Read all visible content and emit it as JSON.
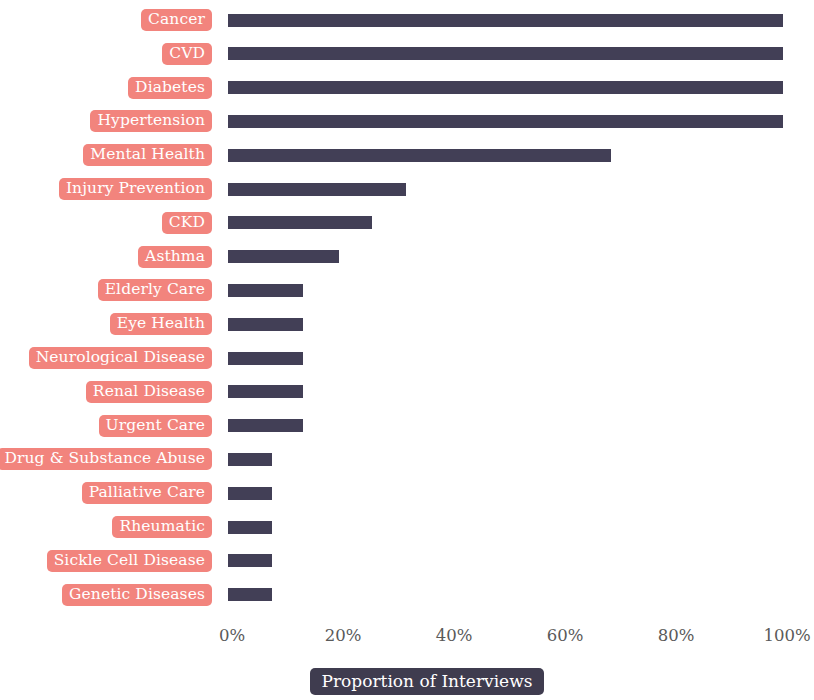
{
  "chart_data": {
    "type": "bar",
    "orientation": "horizontal",
    "title": "",
    "subtitle": "",
    "xlabel": "Proportion of Interviews",
    "ylabel": "",
    "xlim": [
      0,
      100
    ],
    "ylim": null,
    "grid": false,
    "legend": null,
    "legend_position": "none",
    "xtick_labels": [
      "0%",
      "20%",
      "40%",
      "60%",
      "80%",
      "100%"
    ],
    "xtick_values": [
      0,
      20,
      40,
      60,
      80,
      100
    ],
    "categories": [
      "Cancer",
      "CVD",
      "Diabetes",
      "Hypertension",
      "Mental Health",
      "Injury Prevention",
      "CKD",
      "Asthma",
      "Elderly Care",
      "Eye Health",
      "Neurological Disease",
      "Renal Disease",
      "Urgent Care",
      "Drug & Substance Abuse",
      "Palliative Care",
      "Rheumatic",
      "Sickle Cell Disease",
      "Genetic Diseases"
    ],
    "values": [
      100,
      100,
      100,
      100,
      69,
      32,
      26,
      20,
      13.5,
      13.5,
      13.5,
      13.5,
      13.5,
      8,
      8,
      8,
      8,
      8
    ],
    "bar_color": "#423F56",
    "label_background_color": "#F2847D",
    "label_text_color": "#FFFFFF",
    "axis_title_background_color": "#3F3C4F",
    "axis_title_text_color": "#FFFFFF"
  }
}
